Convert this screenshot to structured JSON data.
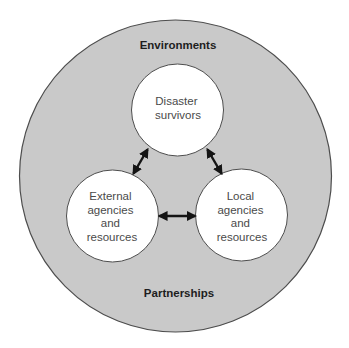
{
  "diagram": {
    "outer": {
      "top_label": "Environments",
      "bottom_label": "Partnerships",
      "fill": "#c9c9c9",
      "stroke": "#4d4d4d"
    },
    "nodes": [
      {
        "id": "survivors",
        "lines": [
          "Disaster",
          "survivors"
        ]
      },
      {
        "id": "external",
        "lines": [
          "External",
          "agencies",
          "and",
          "resources"
        ]
      },
      {
        "id": "local",
        "lines": [
          "Local",
          "agencies",
          "and",
          "resources"
        ]
      }
    ],
    "connections": [
      {
        "from": "survivors",
        "to": "external",
        "type": "bidirectional"
      },
      {
        "from": "survivors",
        "to": "local",
        "type": "bidirectional"
      },
      {
        "from": "external",
        "to": "local",
        "type": "bidirectional"
      }
    ],
    "node_fill": "#ffffff",
    "arrow_color": "#141414"
  }
}
